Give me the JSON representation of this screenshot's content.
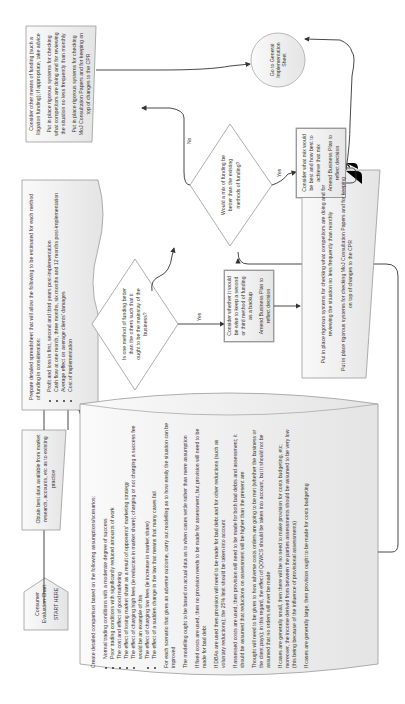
{
  "chart": {
    "start": {
      "title": "Consumer Evaluation Chart",
      "subtitle": "START HERE"
    },
    "obtain_data": "Obtain best data available from market research, accounts, etc as to existing practice",
    "spreadsheet": {
      "intro": "Prepare detailed spreadsheet that will allow the following to be estimated for each method of funding in consideration:",
      "items": [
        "Profit and loss in first, second and third years post-implementation",
        "Cash flow at one month, three months, six months and 12 months post-implementation",
        "Average effect on average clients' damages",
        "Cost of implementation"
      ]
    },
    "comparison": {
      "intro": "Create detailed comparison based on the following assumptions/scenarios:",
      "items": [
        "Normal trading conditions with a moderate degree of success",
        "Poor trading conditions with significantly reduced amounts of work",
        "The cost and effect of good marketing",
        "The effect of losing market share as a result of opponents' marketing strategy",
        "The effect of charging high fees (ie reduction in market share); charging or not charging a success fee would be an example of this",
        "The effect of charging low fees (ie increase in market share)",
        "The effect of a sudden change in the law that means that many cases fail"
      ],
      "paragraphs": [
        "For each scenario that gives an adverse outcome, carry out modelling as to how easily the situation can be improved",
        "The modelling ought to be based on actual data as to when cases settle rather than mere assumption",
        "If fixed costs are used, then no provision needs to be made for assessment, but provision will need to be made for bad debt",
        "If DBAs are used then provision will need to be made for bad debt and for other reductions (such as voluntary reductions); the 25% limit should be taken into account",
        "If assessed costs are used, then provision will need to be made for both bad debts and assessment; it should be assumed that reductions on assessment will be higher than the present are",
        "Thought will need to be given to how adverse costs orders are going to be met (whether the business or the client pays); in this regard, the effect of QOWCS should be taken into account, but it should not be assumed that no orders will ever be made",
        "If cases are generally small, then there will be no need to make provision for costs budgeting, etc; moreover, the income derived from between the parties assessments should be assumed to be very low (this being because of the influence of provisional assessments)",
        "If cases are generally large, then provision ought to be made for costs budgeting"
      ]
    },
    "decision_one": "Is one method of funding better than the others such that it ought to be the mainstay of the business?",
    "decision_two": "Would a mix of funding be better than the existing methods of funding?",
    "yes_label": "Yes",
    "no_label": "No",
    "yes_branch": {
      "line1": "Consider whether it would be wise to keep a second or third method of funding as a backup",
      "line2": "Amend Business Plan to reflect decision"
    },
    "mix_branch": {
      "line1": "Consider what mix would be best and how best to achieve that mix",
      "line2": "Amend Business Plan to reflect decision"
    },
    "systems_box": {
      "line1": "Put in place rigorous systems for checking what competitors are doing and for reviewing the situation no less frequently than monthly",
      "line2": "Put in place rigorous systems for checking MoJ Consultation Papers and for keeping on top of changes to the CPR"
    },
    "no_branch": {
      "line1": "Consider other means of funding (such a litigation funding); if appropriate, take advice",
      "line2": "Put in place rigorous systems for checking what competitors are doing and for reviewing the situation no less frequently than monthly",
      "line3": "Put in place rigorous systems for checking MoJ Consultation Papers and for keeping on top of changes to the CPR"
    },
    "end": "Go to General Implementation Sheet"
  }
}
